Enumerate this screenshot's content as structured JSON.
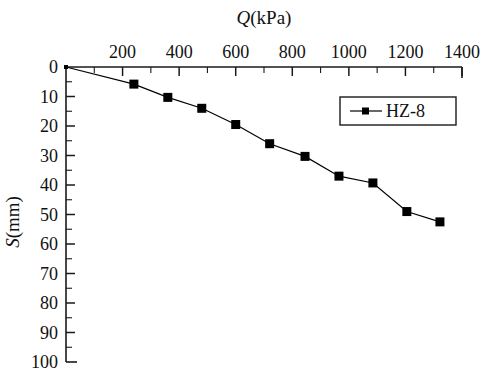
{
  "chart_data": {
    "type": "line",
    "title": "",
    "xlabel": "Q(kPa)",
    "ylabel": "S(mm)",
    "xlim": [
      0,
      1400
    ],
    "ylim": [
      0,
      100
    ],
    "y_inverted": true,
    "x_axis_position": "top",
    "grid": false,
    "legend_position": "top-right",
    "xticks": [
      0,
      200,
      400,
      600,
      800,
      1000,
      1200,
      1400
    ],
    "xtick_labels": [
      "0",
      "200",
      "400",
      "600",
      "800",
      "1000",
      "1200",
      "1400"
    ],
    "x_minor_tick_step": 100,
    "yticks": [
      0,
      10,
      20,
      30,
      40,
      50,
      60,
      70,
      80,
      90,
      100
    ],
    "ytick_labels": [
      "0",
      "10",
      "20",
      "30",
      "40",
      "50",
      "60",
      "70",
      "80",
      "90",
      "100"
    ],
    "y_minor_tick_step": 5,
    "series": [
      {
        "name": "HZ-8",
        "marker": "filled-square",
        "color": "#000000",
        "x": [
          0,
          240,
          360,
          480,
          600,
          720,
          845,
          965,
          1085,
          1205,
          1322
        ],
        "y": [
          0,
          5.8,
          10.3,
          14,
          19.5,
          26,
          30.3,
          37,
          39.3,
          49,
          52.5
        ]
      }
    ],
    "legend_entries": [
      {
        "label": "HZ-8",
        "marker": "filled-square",
        "color": "#000000"
      }
    ]
  },
  "axes": {
    "x_title": "Q(kPa)",
    "x_title_italic_part": "Q",
    "x_title_rest": "(kPa)",
    "y_title": "S(mm)",
    "y_title_italic_part": "S",
    "y_title_rest": "(mm)"
  }
}
